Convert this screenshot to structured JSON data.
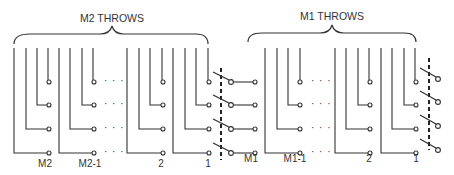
{
  "diagram": {
    "left_section": {
      "title": "M2 THROWS",
      "group_labels": [
        "M2",
        "M2-1",
        "2",
        "1"
      ],
      "ellipsis": "· · ·"
    },
    "right_section": {
      "title": "M1 THROWS",
      "group_labels": [
        "M1",
        "M1-1",
        "2",
        "1"
      ],
      "ellipsis": "· · ·"
    },
    "colors": {
      "line": "#333333",
      "background": "#ffffff"
    }
  }
}
